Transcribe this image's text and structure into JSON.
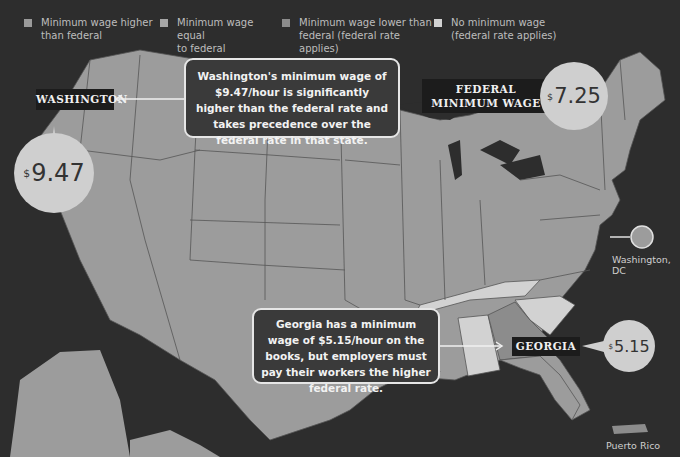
{
  "legend": {
    "items": [
      {
        "label_line1": "Minimum wage higher",
        "label_line2": "than federal",
        "color": "#9a9a9a"
      },
      {
        "label_line1": "Minimum wage equal",
        "label_line2": "to federal",
        "color": "#a6a6a6"
      },
      {
        "label_line1": "Minimum wage lower than",
        "label_line2": "federal (federal rate applies)",
        "color": "#8c8c8c"
      },
      {
        "label_line1": "No minimum wage",
        "label_line2": "(federal rate applies)",
        "color": "#d2d2d2"
      }
    ]
  },
  "washington": {
    "tag": "WASHINGTON",
    "currency": "$",
    "wage": "9.47",
    "callout": "Washington's minimum wage of $9.47/hour is significantly higher than the federal rate and takes precedence over the federal rate in that state."
  },
  "federal": {
    "tag_line1": "FEDERAL",
    "tag_line2": "MINIMUM WAGE",
    "currency": "$",
    "wage": "7.25"
  },
  "georgia": {
    "tag": "GEORGIA",
    "currency": "$",
    "wage": "5.15",
    "callout": "Georgia has a minimum wage of $5.15/hour on the books, but employers must pay their workers the higher federal rate."
  },
  "labels": {
    "dc": "Washington, DC",
    "puerto_rico": "Puerto Rico"
  },
  "colors": {
    "background": "#2d2d2d",
    "land_higher": "#9a9a9a",
    "land_equal": "#a6a6a6",
    "land_lower": "#8c8c8c",
    "land_none": "#d2d2d2",
    "bubble": "#cfcfcf"
  }
}
